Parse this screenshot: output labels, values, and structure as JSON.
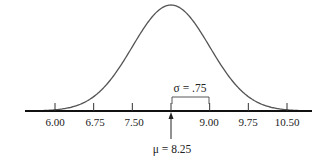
{
  "chart_data": {
    "type": "line",
    "title": "",
    "distribution": "normal",
    "mean": 8.25,
    "std_dev": 0.75,
    "xlabel": "",
    "ylabel": "",
    "x_ticks": [
      6.0,
      6.75,
      7.5,
      8.25,
      9.0,
      9.75,
      10.5
    ],
    "x_tick_labels": [
      "6.00",
      "6.75",
      "7.50",
      "",
      "9.00",
      "9.75",
      "10.50"
    ],
    "xlim": [
      5.6,
      11.1
    ],
    "grid": false,
    "legend": null,
    "annotations": [
      {
        "text": "σ = .75",
        "type": "bracket",
        "from": 8.25,
        "to": 9.0
      },
      {
        "text": "μ = 8.25",
        "type": "arrow",
        "at": 8.25
      }
    ]
  },
  "labels": {
    "t0": "6.00",
    "t1": "6.75",
    "t2": "7.50",
    "t4": "9.00",
    "t5": "9.75",
    "t6": "10.50",
    "sigma": "σ = .75",
    "mu": "μ = 8.25"
  }
}
